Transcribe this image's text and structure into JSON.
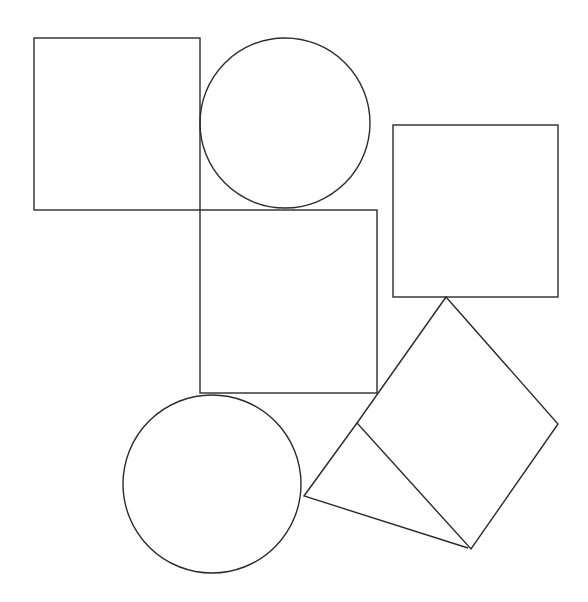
{
  "canvas": {
    "width": 588,
    "height": 602,
    "background": "#ffffff",
    "stroke": "#2b2b2b"
  },
  "shapes": {
    "square_top_left": {
      "x": 34,
      "y": 38,
      "w": 166,
      "h": 172
    },
    "circle_top": {
      "cx": 285,
      "cy": 123,
      "r": 85
    },
    "square_right": {
      "x": 393,
      "y": 125,
      "w": 165,
      "h": 172
    },
    "square_middle": {
      "x": 200,
      "y": 210,
      "w": 177,
      "h": 183
    },
    "circle_bottom": {
      "cx": 212,
      "cy": 484,
      "r": 89
    },
    "diamond": {
      "points": "446,297 558,424 471,549 357,423"
    },
    "triangle": {
      "points": "357,423 304,496 468,548"
    }
  }
}
